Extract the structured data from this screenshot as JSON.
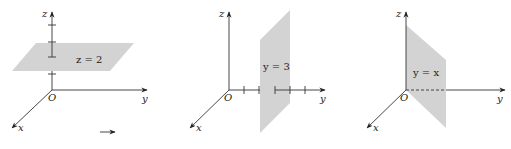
{
  "figures": [
    {
      "id": "panel-z-plane",
      "axes": {
        "x": "x",
        "y": "y",
        "z": "z",
        "origin": "O"
      },
      "plane_label": "z = 2",
      "plane_type": "horizontal",
      "ticks_axis": "z",
      "tick_count": 4
    },
    {
      "id": "panel-y-plane",
      "axes": {
        "x": "x",
        "y": "y",
        "z": "z",
        "origin": "O"
      },
      "plane_label": "y = 3",
      "plane_type": "vertical-parallel-xz",
      "ticks_axis": "y",
      "tick_count": 5
    },
    {
      "id": "panel-yx-plane",
      "axes": {
        "x": "x",
        "y": "y",
        "z": "z",
        "origin": "O"
      },
      "plane_label": "y = x",
      "plane_type": "vertical-diagonal",
      "ticks_axis": "",
      "tick_count": 0
    }
  ],
  "colors": {
    "plane": "#d3d3d3",
    "axis": "#333333"
  }
}
